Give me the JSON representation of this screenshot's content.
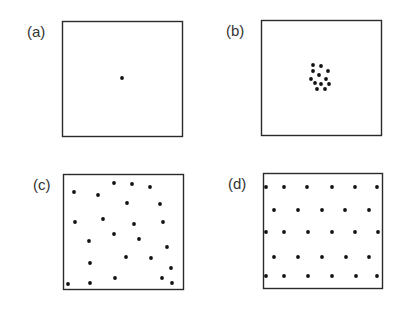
{
  "panels": [
    {
      "label": "(a)",
      "box": {
        "x": 62,
        "y": 21,
        "w": 120,
        "h": 115
      },
      "label_pos": {
        "x": 27,
        "y": 23
      },
      "description": "single point",
      "dots": [
        [
          122,
          78
        ]
      ]
    },
    {
      "label": "(b)",
      "box": {
        "x": 261,
        "y": 20,
        "w": 120,
        "h": 115
      },
      "label_pos": {
        "x": 226,
        "y": 22
      },
      "description": "clustered points",
      "dots": [
        [
          313,
          65
        ],
        [
          321,
          66
        ],
        [
          313,
          71
        ],
        [
          328,
          71
        ],
        [
          319,
          75
        ],
        [
          311,
          79
        ],
        [
          326,
          79
        ],
        [
          315,
          83
        ],
        [
          321,
          84
        ],
        [
          329,
          84
        ],
        [
          317,
          89
        ],
        [
          325,
          89
        ]
      ]
    },
    {
      "label": "(c)",
      "box": {
        "x": 63,
        "y": 174,
        "w": 120,
        "h": 115
      },
      "label_pos": {
        "x": 33,
        "y": 176
      },
      "description": "random points",
      "dots": [
        [
          114,
          183
        ],
        [
          132,
          184
        ],
        [
          150,
          187
        ],
        [
          74,
          192
        ],
        [
          98,
          195
        ],
        [
          127,
          203
        ],
        [
          160,
          204
        ],
        [
          75,
          222
        ],
        [
          103,
          219
        ],
        [
          134,
          224
        ],
        [
          163,
          222
        ],
        [
          114,
          234
        ],
        [
          139,
          239
        ],
        [
          89,
          241
        ],
        [
          167,
          247
        ],
        [
          126,
          257
        ],
        [
          151,
          258
        ],
        [
          90,
          263
        ],
        [
          171,
          268
        ],
        [
          115,
          278
        ],
        [
          162,
          278
        ],
        [
          68,
          284
        ],
        [
          90,
          283
        ],
        [
          172,
          283
        ]
      ]
    },
    {
      "label": "(d)",
      "box": {
        "x": 263,
        "y": 173,
        "w": 119,
        "h": 115
      },
      "label_pos": {
        "x": 228,
        "y": 175
      },
      "description": "regular uniform points",
      "dots": [
        [
          266,
          187
        ],
        [
          284,
          187
        ],
        [
          307,
          187
        ],
        [
          332,
          187
        ],
        [
          355,
          187
        ],
        [
          377,
          187
        ],
        [
          274,
          210
        ],
        [
          298,
          210
        ],
        [
          322,
          210
        ],
        [
          345,
          210
        ],
        [
          369,
          210
        ],
        [
          266,
          232
        ],
        [
          284,
          232
        ],
        [
          308,
          232
        ],
        [
          332,
          232
        ],
        [
          355,
          232
        ],
        [
          378,
          232
        ],
        [
          274,
          257
        ],
        [
          298,
          257
        ],
        [
          322,
          257
        ],
        [
          346,
          257
        ],
        [
          369,
          257
        ],
        [
          266,
          276
        ],
        [
          284,
          276
        ],
        [
          308,
          276
        ],
        [
          332,
          276
        ],
        [
          356,
          276
        ],
        [
          377,
          276
        ]
      ]
    }
  ],
  "style": {
    "stroke": "#2a2a2a",
    "dot": "#111111"
  }
}
